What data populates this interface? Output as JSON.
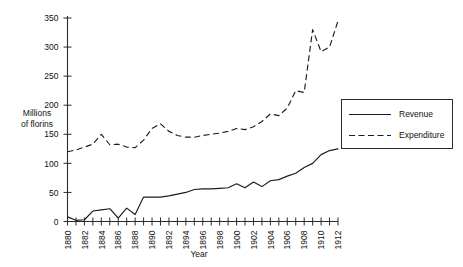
{
  "chart_data": {
    "type": "line",
    "title": "",
    "xlabel": "Year",
    "ylabel": "Millions of florins",
    "ylabel_line1": "Millions",
    "ylabel_line2": "of florins",
    "xlim": [
      1880,
      1912
    ],
    "ylim": [
      0,
      350
    ],
    "ytick_step": 50,
    "xtick_step": 1,
    "xtick_label_step": 2,
    "grid": false,
    "legend_position": "right",
    "yticks": [
      0,
      50,
      100,
      150,
      200,
      250,
      300,
      350
    ],
    "xticks": [
      1880,
      1881,
      1882,
      1883,
      1884,
      1885,
      1886,
      1887,
      1888,
      1889,
      1890,
      1891,
      1892,
      1893,
      1894,
      1895,
      1896,
      1897,
      1898,
      1899,
      1900,
      1901,
      1902,
      1903,
      1904,
      1905,
      1906,
      1907,
      1908,
      1909,
      1910,
      1911,
      1912
    ],
    "xtick_labels": [
      "1880",
      "1882",
      "1884",
      "1886",
      "1888",
      "1890",
      "1892",
      "1894",
      "1896",
      "1898",
      "1900",
      "1902",
      "1904",
      "1906",
      "1908",
      "1910",
      "1912"
    ],
    "x": [
      1880,
      1881,
      1882,
      1883,
      1884,
      1885,
      1886,
      1887,
      1888,
      1889,
      1890,
      1891,
      1892,
      1893,
      1894,
      1895,
      1896,
      1897,
      1898,
      1899,
      1900,
      1901,
      1902,
      1903,
      1904,
      1905,
      1906,
      1907,
      1908,
      1909,
      1910,
      1911,
      1912
    ],
    "series": [
      {
        "name": "Revenue",
        "style": "solid",
        "color": "#1c1c1c",
        "values": [
          8,
          2,
          3,
          18,
          20,
          22,
          6,
          23,
          12,
          42,
          42,
          42,
          44,
          47,
          50,
          55,
          56,
          56,
          57,
          58,
          65,
          58,
          68,
          60,
          70,
          72,
          78,
          83,
          93,
          100,
          115,
          122,
          125
        ]
      },
      {
        "name": "Expenditure",
        "style": "dashed",
        "color": "#1c1c1c",
        "values": [
          120,
          123,
          128,
          133,
          150,
          132,
          133,
          128,
          127,
          140,
          160,
          168,
          155,
          148,
          145,
          145,
          148,
          150,
          152,
          155,
          160,
          158,
          163,
          172,
          185,
          182,
          195,
          225,
          222,
          330,
          292,
          300,
          345
        ]
      }
    ]
  },
  "legend": {
    "items": [
      {
        "label": "Revenue",
        "style": "solid"
      },
      {
        "label": "Expenditure",
        "style": "dashed"
      }
    ]
  }
}
